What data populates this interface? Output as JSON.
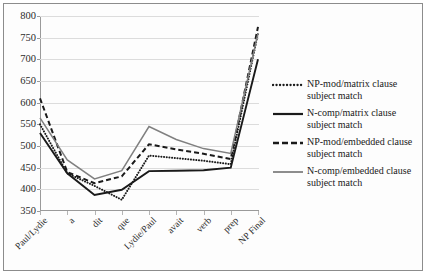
{
  "chart_data": {
    "type": "line",
    "title": "",
    "xlabel": "",
    "ylabel": "",
    "ylim": [
      350,
      800
    ],
    "ytick_step": 50,
    "yticks": [
      350,
      400,
      450,
      500,
      550,
      600,
      650,
      700,
      750,
      800
    ],
    "grid": true,
    "legend_position": "right",
    "categories": [
      "Paul/Lydie",
      "a",
      "dit",
      "que",
      "Lydie/Paul",
      "avait",
      "verb",
      "prep",
      "NP Final"
    ],
    "series": [
      {
        "name": "NP-mod/matrix clause subject match",
        "style": "dotted",
        "color": "#1a1a1a",
        "values": [
          550,
          437,
          408,
          376,
          478,
          472,
          466,
          458,
          760
        ]
      },
      {
        "name": "N-comp/matrix clause subject match",
        "style": "solid-thick",
        "color": "#1a1a1a",
        "values": [
          530,
          437,
          387,
          399,
          442,
          443,
          444,
          450,
          700
        ]
      },
      {
        "name": "NP-mod/embedded clause subject match",
        "style": "dashed",
        "color": "#1a1a1a",
        "values": [
          610,
          440,
          414,
          430,
          504,
          492,
          482,
          470,
          775
        ]
      },
      {
        "name": "N-comp/embedded clause subject match",
        "style": "solid-gray",
        "color": "#808080",
        "values": [
          565,
          468,
          424,
          443,
          545,
          515,
          494,
          483,
          760
        ]
      }
    ]
  },
  "legend": {
    "entries": [
      {
        "label": "NP-mod/matrix clause subject match",
        "swatch": "dotted-line-swatch"
      },
      {
        "label": "N-comp/matrix clause subject match",
        "swatch": "solid-line-swatch"
      },
      {
        "label": "NP-mod/embedded clause subject match",
        "swatch": "dashed-line-swatch"
      },
      {
        "label": "N-comp/embedded clause subject match",
        "swatch": "gray-line-swatch"
      }
    ]
  },
  "colors": {
    "series_black": "#1a1a1a",
    "series_gray": "#808080",
    "gridline": "#dcdcdc",
    "axis": "#9a9a9a",
    "frame": "#8c8c8c",
    "background": "#fdfdfd"
  }
}
